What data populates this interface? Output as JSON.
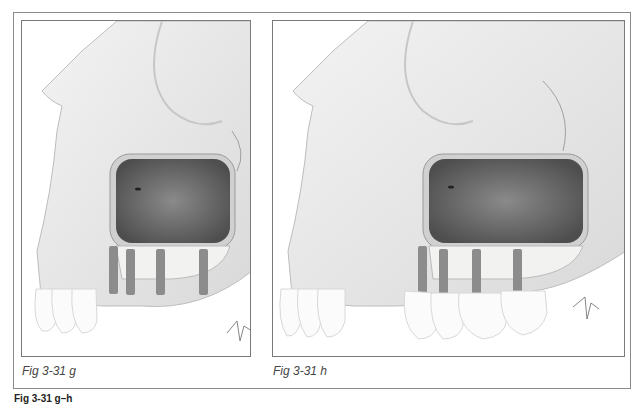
{
  "figure": {
    "panels": [
      {
        "id": "g",
        "caption": "Fig 3-31 g",
        "description": "Maxillary sinus with bone graft; four implants placed, anterior natural teeth present",
        "implant_count": 4,
        "crowns": false,
        "signature": "artist-signature"
      },
      {
        "id": "h",
        "caption": "Fig 3-31 h",
        "description": "Maxillary sinus with bone graft; four implants restored with crowns",
        "implant_count": 4,
        "crowns": true,
        "signature": "artist-signature"
      }
    ],
    "legend_partial": "Fig 3-31 g–h"
  },
  "colors": {
    "frame": "#8a8a8a",
    "bone": "#e6e6e6",
    "sinus": "#6f6f6f",
    "graft": "#f2f2f0",
    "implant": "#8c8c8c",
    "tooth": "#fbfbfb"
  }
}
